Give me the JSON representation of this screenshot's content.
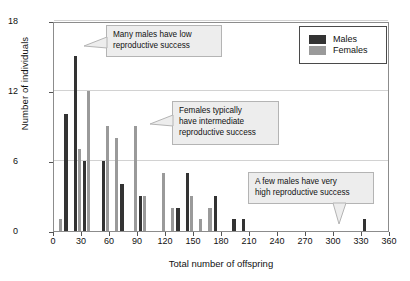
{
  "chart_data": {
    "type": "bar",
    "title": "",
    "xlabel": "Total number of offspring",
    "ylabel": "Number of individuals",
    "xlim": [
      0,
      360
    ],
    "ylim": [
      0,
      18
    ],
    "xticks": [
      0,
      30,
      60,
      90,
      120,
      150,
      180,
      210,
      240,
      270,
      300,
      330,
      360
    ],
    "yticks": [
      0,
      6,
      12,
      18
    ],
    "grid": "horizontal",
    "bin_width": 10,
    "legend_position": "top-right",
    "categories": [
      5,
      15,
      25,
      35,
      45,
      55,
      65,
      75,
      85,
      95,
      105,
      115,
      125,
      135,
      145,
      155,
      165,
      175,
      185,
      195,
      205,
      215,
      225,
      235,
      245,
      255,
      265,
      275,
      285,
      295,
      305,
      315,
      325,
      335,
      345,
      355
    ],
    "series": [
      {
        "name": "Males",
        "color": "#333333",
        "values": [
          0,
          10,
          15,
          6,
          0,
          6,
          0,
          4,
          0,
          3,
          0,
          0,
          0,
          2,
          5,
          0,
          0,
          3,
          0,
          1,
          1,
          0,
          0,
          0,
          0,
          0,
          0,
          0,
          0,
          0,
          0,
          0,
          0,
          1,
          0,
          0
        ]
      },
      {
        "name": "Females",
        "color": "#9a9a9a",
        "values": [
          1,
          0,
          7,
          12,
          0,
          9,
          8,
          0,
          9,
          3,
          0,
          5,
          2,
          0,
          3,
          1,
          2,
          0,
          0,
          0,
          0,
          0,
          0,
          0,
          0,
          0,
          0,
          0,
          0,
          0,
          0,
          0,
          0,
          0,
          0,
          0
        ]
      }
    ],
    "annotations": [
      {
        "id": "many-males-low",
        "text": "Many males have low reproductive success",
        "line1": "Many males have low",
        "line2": "reproductive success",
        "points_to": "tall male bar near 25 offspring"
      },
      {
        "id": "females-intermediate",
        "text": "Females typically have intermediate reproductive success",
        "line1": "Females typically",
        "line2": "have intermediate",
        "line3": "reproductive success",
        "points_to": "female bars near 85 offspring"
      },
      {
        "id": "few-males-high",
        "text": "A few males have very high reproductive success",
        "line1": "A few males have very",
        "line2": "high reproductive success",
        "points_to": "lone male bar near 340 offspring"
      }
    ]
  },
  "legend": {
    "items": [
      {
        "label": "Males",
        "color": "#333333"
      },
      {
        "label": "Females",
        "color": "#9a9a9a"
      }
    ]
  },
  "axes": {
    "y_title": "Number of individuals",
    "x_title": "Total number of offspring",
    "y_tick_labels": [
      "0",
      "6",
      "12",
      "18"
    ],
    "x_tick_labels": [
      "0",
      "30",
      "60",
      "90",
      "120",
      "150",
      "180",
      "210",
      "240",
      "270",
      "300",
      "330",
      "360"
    ]
  }
}
